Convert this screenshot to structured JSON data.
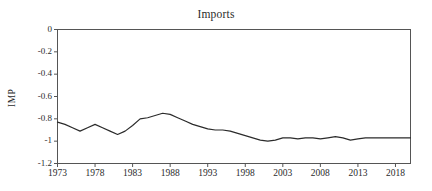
{
  "chart_data": {
    "type": "line",
    "title": "Imports",
    "xlabel": "",
    "ylabel": "IMP",
    "legend": null,
    "grid": false,
    "xlim": [
      1973,
      2020
    ],
    "ylim": [
      -1.2,
      0
    ],
    "y_ticks": [
      0,
      -0.2,
      -0.4,
      -0.6,
      -0.8,
      -1,
      -1.2
    ],
    "y_tick_labels": [
      "0",
      "-0.2",
      "-0.4",
      "-0.6",
      "-0.8",
      "-1",
      "-1.2"
    ],
    "x_ticks": [
      1973,
      1978,
      1983,
      1988,
      1993,
      1998,
      2003,
      2008,
      2013,
      2018
    ],
    "x_tick_labels": [
      "1973",
      "1978",
      "1983",
      "1988",
      "1993",
      "1998",
      "2003",
      "2008",
      "2013",
      "2018"
    ],
    "series": [
      {
        "name": "IMP",
        "color": "#2b2b2b",
        "x": [
          1973,
          1974,
          1975,
          1976,
          1977,
          1978,
          1979,
          1980,
          1981,
          1982,
          1983,
          1984,
          1985,
          1986,
          1987,
          1988,
          1989,
          1990,
          1991,
          1992,
          1993,
          1994,
          1995,
          1996,
          1997,
          1998,
          1999,
          2000,
          2001,
          2002,
          2003,
          2004,
          2005,
          2006,
          2007,
          2008,
          2009,
          2010,
          2011,
          2012,
          2013,
          2014,
          2015,
          2016,
          2017,
          2018,
          2019,
          2020
        ],
        "values": [
          -0.83,
          -0.85,
          -0.88,
          -0.91,
          -0.88,
          -0.85,
          -0.88,
          -0.91,
          -0.94,
          -0.91,
          -0.86,
          -0.8,
          -0.79,
          -0.77,
          -0.75,
          -0.76,
          -0.79,
          -0.82,
          -0.85,
          -0.87,
          -0.89,
          -0.9,
          -0.9,
          -0.91,
          -0.93,
          -0.95,
          -0.97,
          -0.99,
          -1.0,
          -0.99,
          -0.97,
          -0.97,
          -0.98,
          -0.97,
          -0.97,
          -0.98,
          -0.97,
          -0.96,
          -0.97,
          -0.99,
          -0.98,
          -0.97,
          -0.97,
          -0.97,
          -0.97,
          -0.97,
          -0.97,
          -0.97
        ]
      }
    ]
  },
  "axes": {
    "box_color": "#555555",
    "line_color": "#2b2b2b"
  }
}
